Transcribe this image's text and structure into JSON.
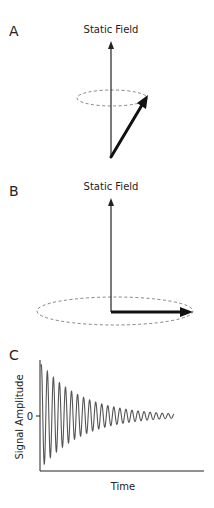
{
  "panels": {
    "a": {
      "label": "A",
      "axis_label": "Static Field"
    },
    "b": {
      "label": "B",
      "axis_label": "Static Field"
    },
    "c": {
      "label": "C",
      "y_label": "Signal Amplitude",
      "x_label": "Time",
      "zero_tick": "0"
    }
  },
  "colors": {
    "line": "#222222",
    "dashed": "#777777",
    "signal": "#555555"
  }
}
